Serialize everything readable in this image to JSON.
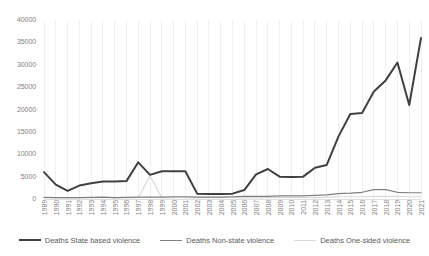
{
  "chart_data": {
    "type": "line",
    "title": "",
    "xlabel": "",
    "ylabel": "",
    "ylim": [
      0,
      40000
    ],
    "ytick_values": [
      0,
      5000,
      10000,
      15000,
      20000,
      25000,
      30000,
      35000,
      40000
    ],
    "ytick_labels": [
      "0",
      "5000",
      "10000",
      "15000",
      "20000",
      "25000",
      "30000",
      "35000",
      "40000"
    ],
    "grid": true,
    "grid_axis": "x",
    "legend_position": "bottom",
    "categories": [
      "1989",
      "1990",
      "1991",
      "1992",
      "1993",
      "1994",
      "1995",
      "1996",
      "1997",
      "1998",
      "1999",
      "2000",
      "2001",
      "2002",
      "2003",
      "2004",
      "2005",
      "2006",
      "2007",
      "2008",
      "2009",
      "2010",
      "2011",
      "2012",
      "2013",
      "2014",
      "2015",
      "2016",
      "2017",
      "2018",
      "2019",
      "2020",
      "2021"
    ],
    "series": [
      {
        "name": "Deaths State based violence",
        "color": "#404040",
        "width": 2.0,
        "values": [
          6000,
          3200,
          1800,
          3000,
          3500,
          3900,
          3900,
          4000,
          8200,
          5400,
          6200,
          6200,
          6200,
          1200,
          1100,
          1100,
          1200,
          2000,
          5500,
          6700,
          5000,
          4900,
          5000,
          7000,
          7600,
          14000,
          19000,
          19200,
          24000,
          26500,
          30500,
          21000,
          36000
        ]
      },
      {
        "name": "Deaths Non-state violence",
        "color": "#7f7f7f",
        "width": 1.2,
        "values": [
          350,
          300,
          300,
          300,
          350,
          400,
          300,
          350,
          400,
          400,
          400,
          500,
          500,
          400,
          400,
          400,
          500,
          600,
          600,
          600,
          700,
          700,
          700,
          800,
          900,
          1200,
          1300,
          1500,
          2100,
          2100,
          1500,
          1400,
          1400
        ]
      },
      {
        "name": "Deaths One-sided violence",
        "color": "#d9d9d9",
        "width": 1.2,
        "values": [
          300,
          300,
          300,
          300,
          300,
          300,
          300,
          300,
          300,
          5200,
          300,
          300,
          300,
          300,
          300,
          300,
          300,
          300,
          300,
          300,
          300,
          300,
          300,
          300,
          400,
          500,
          500,
          500,
          600,
          600,
          600,
          500,
          500
        ]
      }
    ]
  },
  "legend": {
    "items": [
      {
        "label": "Deaths State based violence"
      },
      {
        "label": "Deaths Non-state violence"
      },
      {
        "label": "Deaths One-sided violence"
      }
    ]
  }
}
